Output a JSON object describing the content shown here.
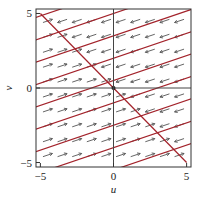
{
  "chart_data": {
    "type": "line",
    "subtype": "phase-portrait-direction-field",
    "title": "",
    "xlabel": "u",
    "ylabel": "v",
    "xlim": [
      -5.3,
      5.3
    ],
    "ylim": [
      -5.3,
      5.3
    ],
    "xticks": [
      -5,
      0,
      5
    ],
    "yticks": [
      -5,
      0,
      5
    ],
    "xtick_labels": [
      "-5",
      "0",
      "5"
    ],
    "ytick_labels": [
      "-5",
      "0",
      "5"
    ],
    "grid": false,
    "zero_lines": true,
    "direction_field": {
      "grid_u": [
        -4.5,
        -3.5,
        -2.5,
        -1.5,
        -0.5,
        0.5,
        1.5,
        2.5,
        3.5,
        4.5
      ],
      "grid_v": [
        -4.5,
        -3.5,
        -2.5,
        -1.5,
        -0.5,
        0.5,
        1.5,
        2.5,
        3.5,
        4.5
      ],
      "rule": "arrows point left-down (slope 1/3) above line v = -u, right-up (slope 1/3) below it",
      "arrow_color": "#555555"
    },
    "nullcline": {
      "equation": "v = -u",
      "from": [
        -5,
        5
      ],
      "to": [
        5,
        -5
      ],
      "color": "#a3232b"
    },
    "trajectories": {
      "slope": 0.3333,
      "intercepts": [
        -5.5,
        -4,
        -2.5,
        -1,
        0.5,
        2,
        3.5,
        5,
        6.5
      ],
      "color": "#a3232b"
    },
    "colors": {
      "trajectory": "#a3232b",
      "arrow": "#555555",
      "frame": "#333333"
    }
  }
}
